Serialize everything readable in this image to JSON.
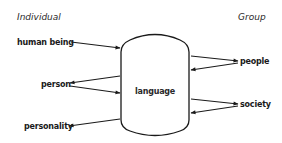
{
  "headers": {
    "left": "Individual",
    "right": "Group"
  },
  "center": {
    "label": "language",
    "shape": "barrel"
  },
  "nodes": [
    {
      "id": "human_being",
      "label": "human being",
      "side": "left"
    },
    {
      "id": "person",
      "label": "person",
      "side": "left"
    },
    {
      "id": "personality",
      "label": "personality",
      "side": "left"
    },
    {
      "id": "people",
      "label": "people",
      "side": "right"
    },
    {
      "id": "society",
      "label": "society",
      "side": "right"
    }
  ],
  "edges": [
    {
      "from": "human being",
      "to": "language"
    },
    {
      "from": "language",
      "to": "person"
    },
    {
      "from": "person",
      "to": "language"
    },
    {
      "from": "language",
      "to": "personality"
    },
    {
      "from": "language",
      "to": "people"
    },
    {
      "from": "people",
      "to": "language"
    },
    {
      "from": "language",
      "to": "society"
    },
    {
      "from": "society",
      "to": "language"
    }
  ],
  "colors": {
    "ink": "#1a1a1a",
    "background": "#ffffff"
  }
}
